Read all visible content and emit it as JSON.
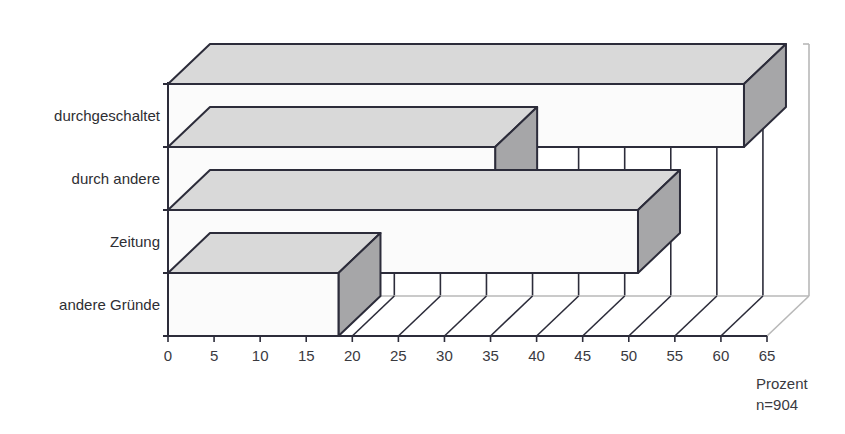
{
  "chart_data": {
    "type": "bar",
    "orientation": "horizontal",
    "style": "3d",
    "title": "",
    "categories": [
      "durchgeschaltet",
      "durch andere",
      "Zeitung",
      "andere Gründe"
    ],
    "values": [
      62.5,
      35.5,
      51,
      18.5
    ],
    "xlabel": "Prozent",
    "sample_note": "n=904",
    "ylabel": "",
    "xlim": [
      0,
      65
    ],
    "x_ticks": [
      0,
      5,
      10,
      15,
      20,
      25,
      30,
      35,
      40,
      45,
      50,
      55,
      60,
      65
    ],
    "grid": true,
    "legend": null
  },
  "colors": {
    "front_face": "#fbfbfb",
    "top_face": "#d9d9d9",
    "side_face": "#a6a6a8",
    "outline": "#2c2c3a",
    "back_wall_edge": "#b8b8b8",
    "text": "#333338"
  },
  "axis": {
    "unit_label": "Prozent",
    "n_label": "n=904"
  }
}
